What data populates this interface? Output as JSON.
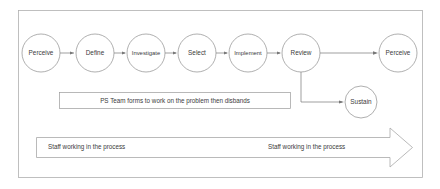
{
  "diagram": {
    "frame": {
      "stroke_color": "#b0b0b0"
    },
    "nodes": [
      {
        "id": "perceive-1",
        "label": "Perceive",
        "cx": 41,
        "cy": 53,
        "r": 19
      },
      {
        "id": "define",
        "label": "Define",
        "cx": 95,
        "cy": 53,
        "r": 19
      },
      {
        "id": "investigate",
        "label": "Investigate",
        "cx": 146,
        "cy": 53,
        "r": 19
      },
      {
        "id": "select",
        "label": "Select",
        "cx": 197,
        "cy": 53,
        "r": 19
      },
      {
        "id": "implement",
        "label": "Implement",
        "cx": 248,
        "cy": 53,
        "r": 19
      },
      {
        "id": "review",
        "label": "Review",
        "cx": 301,
        "cy": 53,
        "r": 19
      },
      {
        "id": "perceive-2",
        "label": "Perceive",
        "cx": 398,
        "cy": 53,
        "r": 19
      },
      {
        "id": "sustain",
        "label": "Sustain",
        "cx": 361,
        "cy": 102,
        "r": 16
      }
    ],
    "connectors": [
      {
        "from": "perceive-1",
        "to": "define"
      },
      {
        "from": "define",
        "to": "investigate"
      },
      {
        "from": "investigate",
        "to": "select"
      },
      {
        "from": "select",
        "to": "implement"
      },
      {
        "from": "implement",
        "to": "review"
      },
      {
        "from": "review",
        "to": "perceive-2"
      },
      {
        "from": "review",
        "to": "sustain",
        "style": "elbow-down-right"
      }
    ],
    "callout": {
      "text": "PS Team forms to work on the problem then disbands",
      "x": 59,
      "y": 92,
      "width": 232,
      "height": 17
    },
    "banner": {
      "left_label": "Staff working in the process",
      "right_label": "Staff working in the process",
      "x": 36,
      "y": 137,
      "width": 377,
      "height": 21
    }
  }
}
